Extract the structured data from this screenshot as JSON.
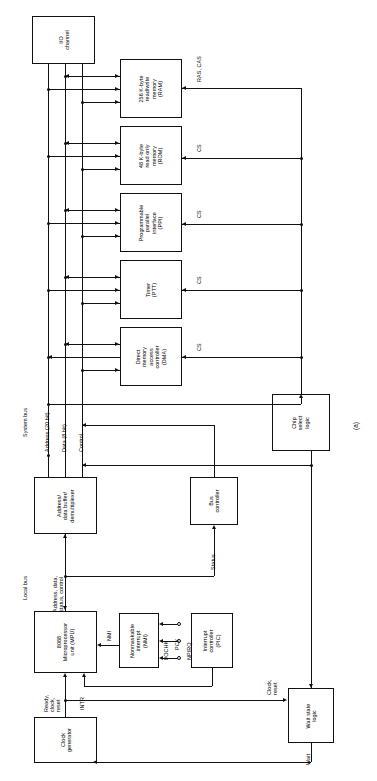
{
  "figure": {
    "caption": "(a)",
    "orientation": "rotated-90"
  },
  "blocks": {
    "io_channel": {
      "label": "I/O\nchannel",
      "lines": [
        "I/O",
        "channel"
      ]
    },
    "ram": {
      "label": "256 K-byte read/write memory (RAM)",
      "lines": [
        "256 K-byte",
        "read/write",
        "memory",
        "(RAM)"
      ]
    },
    "rom": {
      "label": "48 K-byte read only memory (ROM)",
      "lines": [
        "48 K-byte",
        "read only",
        "memory",
        "(ROM)"
      ]
    },
    "ppi": {
      "label": "Programmable parallel interface (PPI)",
      "lines": [
        "Programmable",
        "parallel",
        "interface",
        "(PPI)"
      ]
    },
    "timer": {
      "label": "Timer (PTT)",
      "lines": [
        "Timer",
        "(PTT)"
      ]
    },
    "dma": {
      "label": "Direct memory access controller (DMA)",
      "lines": [
        "Direct",
        "memory",
        "access",
        "controller",
        "(DMA)"
      ]
    },
    "chip_select": {
      "label": "Chip select logic",
      "lines": [
        "Chip",
        "select",
        "logic"
      ]
    },
    "addr_buffer": {
      "label": "Address/ data buffer/ demultiplexer",
      "lines": [
        "Address/",
        "data buffer/",
        "demultiplexer"
      ]
    },
    "bus_controller": {
      "label": "Bus controller",
      "lines": [
        "Bus",
        "controller"
      ]
    },
    "mpu": {
      "label": "8088 Microprocessor unit (MPU)",
      "lines": [
        "8088",
        "Microprocessor",
        "unit (MPU)"
      ]
    },
    "nmi_block": {
      "label": "Nonmaskable interrupt (NMI)",
      "lines": [
        "Nonmaskable",
        "interrupt",
        "(NMI)"
      ]
    },
    "pic": {
      "label": "Interrupt controller (PIC)",
      "lines": [
        "Interrupt",
        "controller",
        "(PIC)"
      ]
    },
    "clock_generator": {
      "label": "Clock generator",
      "lines": [
        "Clock",
        "generator"
      ]
    },
    "wait_logic": {
      "label": "Wait state logic",
      "lines": [
        "Wait state",
        "logic"
      ]
    }
  },
  "buses": {
    "system_bus": "System bus",
    "local_bus": "Local bus",
    "address": "Address (20 bit)",
    "data": "Data (8 bit)",
    "control": "Control",
    "local_lines": [
      "Address, data,",
      "status, control"
    ]
  },
  "signals": {
    "ras_cas": "RAS, CAS",
    "cs_rom": "CS",
    "cs_ppi": "CS",
    "cs_timer": "CS",
    "cs_dma": "CS",
    "status": "Status",
    "nmi": "NMI",
    "intr": "INTR",
    "npirq": "NPIRQ",
    "pck": "PCK",
    "iochk": "I/OCHK",
    "wait": "Wait",
    "clock_reset": [
      "Clock,",
      "reset"
    ],
    "ready_clock_reset": [
      "Ready,",
      "clock,",
      "reset"
    ]
  },
  "colors": {
    "line": "#111111",
    "background": "#ffffff",
    "text": "#000000"
  }
}
